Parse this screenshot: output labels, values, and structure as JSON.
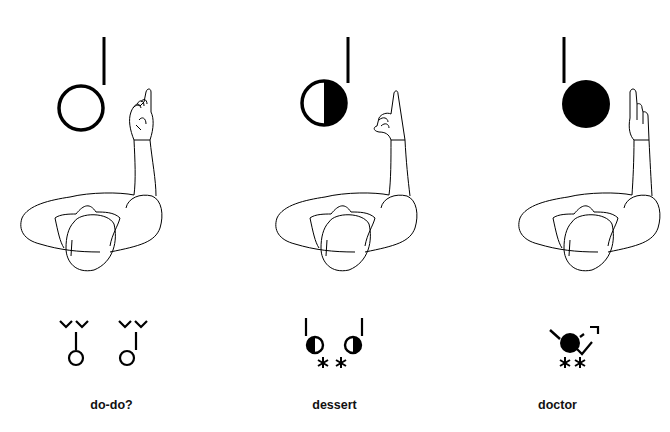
{
  "diagram": {
    "ink_color": "#000000",
    "background": "#ffffff",
    "panels": [
      {
        "id": "do-do",
        "label": "do-do?",
        "circle_fill": "empty",
        "hand": "index finger pointing up, other fingers curled",
        "notation": "two empty circles with stems, double-chevron marks above each"
      },
      {
        "id": "dessert",
        "label": "dessert",
        "circle_fill": "half",
        "hand": "index finger up, thumb touching curled fingers",
        "notation": "two half-filled circles with stems, two asterisks below"
      },
      {
        "id": "doctor",
        "label": "doctor",
        "circle_fill": "full",
        "hand": "index finger up, other fingers slightly extended",
        "notation": "filled circle with slash and hooked arrow, two asterisks below"
      }
    ]
  }
}
